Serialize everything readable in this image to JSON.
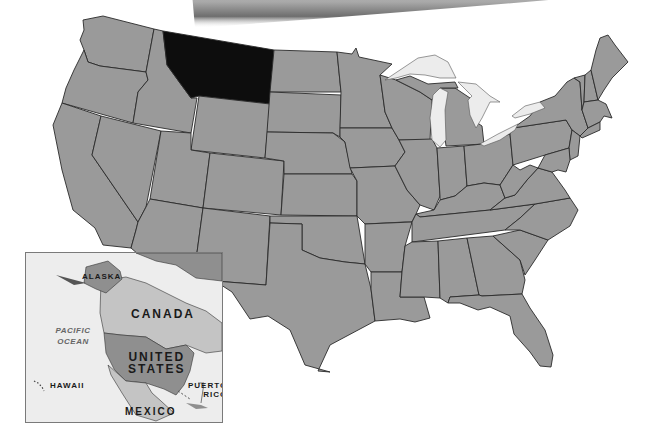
{
  "map": {
    "title": "United States",
    "highlighted_state": "Montana",
    "colors": {
      "state_fill": "#9a9a9a",
      "highlight_fill": "#0d0d0d",
      "border": "#2a2a2a",
      "lake_fill": "#ececec",
      "background": "#ffffff",
      "inset_background": "#ededed",
      "inset_us": "#8f8f8f",
      "inset_neighbor": "#c4c4c4"
    }
  },
  "inset": {
    "labels": {
      "alaska": "ALASKA",
      "canada": "CANADA",
      "united_states_line1": "UNITED",
      "united_states_line2": "STATES",
      "hawaii": "HAWAII",
      "puerto_rico_line1": "PUERTO",
      "puerto_rico_line2": "RICO",
      "mexico": "MEXICO",
      "ocean_line1": "PACIFIC",
      "ocean_line2": "OCEAN"
    }
  }
}
